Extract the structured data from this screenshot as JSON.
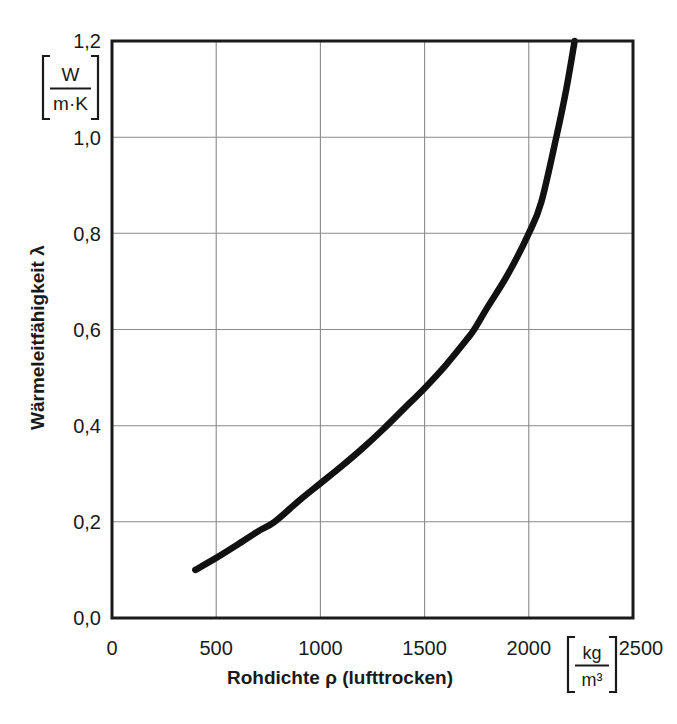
{
  "chart_data": {
    "type": "line",
    "title": "",
    "xlabel": "Rohdichte ρ (lufttrocken)",
    "ylabel": "Wärmeleitfähigkeit λ",
    "x_unit_numerator": "kg",
    "x_unit_denominator": "m³",
    "y_unit_numerator": "W",
    "y_unit_denominator": "m·K",
    "xlim": [
      0,
      2500
    ],
    "ylim": [
      0.0,
      1.2
    ],
    "grid": true,
    "legend": "none",
    "x_ticks": [
      0,
      500,
      1000,
      1500,
      2000,
      2500
    ],
    "x_tick_labels": [
      "0",
      "500",
      "1000",
      "1500",
      "2000",
      "2500"
    ],
    "y_ticks": [
      0.0,
      0.2,
      0.4,
      0.6,
      0.8,
      1.0,
      1.2
    ],
    "y_tick_labels": [
      "0,0",
      "0,2",
      "0,4",
      "0,6",
      "0,8",
      "1,0",
      "1,2"
    ],
    "series": [
      {
        "name": "Wärmeleitfähigkeit",
        "color": "#111111",
        "x": [
          400,
          500,
          600,
          700,
          780,
          900,
          1000,
          1100,
          1200,
          1300,
          1400,
          1500,
          1600,
          1700,
          1738,
          1800,
          1900,
          2000,
          2060,
          2132,
          2180,
          2220
        ],
        "y": [
          0.1,
          0.125,
          0.152,
          0.18,
          0.2,
          0.245,
          0.28,
          0.315,
          0.352,
          0.392,
          0.435,
          0.478,
          0.525,
          0.578,
          0.6,
          0.645,
          0.715,
          0.8,
          0.865,
          1.0,
          1.1,
          1.2
        ]
      }
    ],
    "annotations": []
  },
  "axes": {
    "y_unit_bracket_label": "[W / (m·K)]",
    "x_unit_bracket_label": "[kg / m³]"
  }
}
